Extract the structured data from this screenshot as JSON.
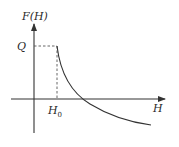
{
  "diagram": {
    "title": "",
    "y_axis_label": "F(H)",
    "x_axis_label": "H",
    "y_marker_label": "Q",
    "x_marker_label_base": "H",
    "x_marker_label_sub": "0",
    "curve_description": "Constant value Q up to H0, then decreasing hyperbola-like curve crossing the H axis and approaching a negative asymptote",
    "colors": {
      "axis": "#333333",
      "curve": "#333333",
      "dashed": "#555555",
      "text": "#2a2a2a"
    }
  }
}
